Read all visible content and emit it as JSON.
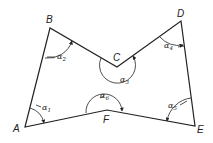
{
  "diagram": {
    "type": "polygon-angles",
    "vertices": [
      {
        "id": "A",
        "label": "A",
        "x": 25,
        "y": 127
      },
      {
        "id": "B",
        "label": "B",
        "x": 50,
        "y": 28
      },
      {
        "id": "C",
        "label": "C",
        "x": 117,
        "y": 67
      },
      {
        "id": "D",
        "label": "D",
        "x": 181,
        "y": 21
      },
      {
        "id": "E",
        "label": "E",
        "x": 195,
        "y": 126
      },
      {
        "id": "F",
        "label": "F",
        "x": 107,
        "y": 110
      }
    ],
    "angles": [
      {
        "symbol": "α",
        "sub": "1",
        "vertex": "A"
      },
      {
        "symbol": "α",
        "sub": "2",
        "vertex": "B"
      },
      {
        "symbol": "α",
        "sub": "3",
        "vertex": "C"
      },
      {
        "symbol": "α",
        "sub": "4",
        "vertex": "D"
      },
      {
        "symbol": "α",
        "sub": "5",
        "vertex": "E"
      },
      {
        "symbol": "α",
        "sub": "6",
        "vertex": "F"
      }
    ],
    "line_color": "#222222",
    "background": "#ffffff"
  }
}
